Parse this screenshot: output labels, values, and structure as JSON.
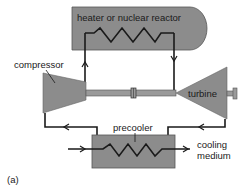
{
  "diagram": {
    "panel_label": "(a)",
    "components": {
      "heater": {
        "label": "heater or nuclear reactor"
      },
      "compressor": {
        "label": "compressor"
      },
      "turbine": {
        "label": "turbine"
      },
      "precooler": {
        "label": "precooler"
      },
      "cooling": {
        "label_line1": "cooling",
        "label_line2": "medium"
      }
    },
    "colors": {
      "fill": "#8c8c8c",
      "stroke": "#1a1a1a",
      "background": "#ffffff"
    }
  }
}
